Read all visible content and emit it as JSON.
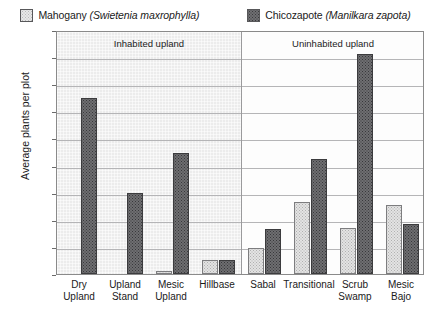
{
  "chart_data": {
    "type": "bar",
    "title": "",
    "xlabel": "",
    "ylabel": "Average plants per plot",
    "ylim": [
      0,
      1.8
    ],
    "ytick_labels": [
      "0",
      "0.2",
      "0.4",
      "0.6",
      "0.8",
      "1",
      "1.2",
      "1.4",
      "1.6",
      "1.8"
    ],
    "ytick_values": [
      0,
      0.2,
      0.4,
      0.6,
      0.8,
      1.0,
      1.2,
      1.4,
      1.6,
      1.8
    ],
    "grid": true,
    "legend_position": "top",
    "categories": [
      "Dry\nUpland",
      "Upland\nStand",
      "Mesic\nUpland",
      "Hillbase",
      "Sabal",
      "Transitional",
      "Scrub\nSwamp",
      "Mesic\nBajo"
    ],
    "series": [
      {
        "name": "Mahogany (Swietenia maxrophylla)",
        "short_name": "Mahogany",
        "scientific_name": "Swietenia maxrophylla",
        "color": "#e3e3e3",
        "values": [
          0.0,
          0.0,
          0.02,
          0.1,
          0.19,
          0.53,
          0.34,
          0.51
        ]
      },
      {
        "name": "Chicozapote (Manilkara zapota)",
        "short_name": "Chicozapote",
        "scientific_name": "Manilkara zapota",
        "color": "#6e6e71",
        "values": [
          1.3,
          0.6,
          0.89,
          0.1,
          0.33,
          0.85,
          1.62,
          0.37
        ]
      }
    ],
    "annotations": [
      {
        "text": "Inhabited upland",
        "span_start": 0,
        "span_end": 3,
        "shaded": true
      },
      {
        "text": "Uninhabited upland",
        "span_start": 4,
        "span_end": 7,
        "shaded": false
      }
    ]
  },
  "legend": {
    "entries": [
      {
        "label_common": "Mahogany ",
        "label_sci": "(Swietenia maxrophylla)",
        "swatch": "mahogany-swatch"
      },
      {
        "label_common": "Chicozapote ",
        "label_sci": "(Manilkara zapota)",
        "swatch": "chicozapote-swatch"
      }
    ]
  }
}
